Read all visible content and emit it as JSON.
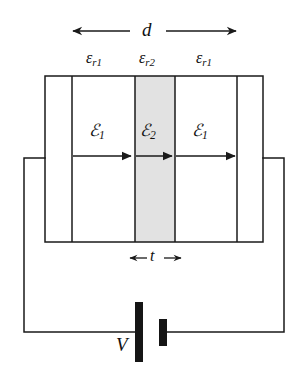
{
  "figure": {
    "colors": {
      "line": "#1a1a1a",
      "background": "#ffffff",
      "slab_fill": "#e2e2e2",
      "battery_fill": "#151515"
    }
  },
  "dimensions": {
    "total_gap": {
      "symbol": "d",
      "description": "total separation between capacitor plates"
    },
    "slab_thickness": {
      "symbol": "t",
      "description": "thickness of the middle dielectric slab"
    }
  },
  "dielectrics": [
    {
      "id": "left",
      "base": "ε",
      "subscript": "r1",
      "shaded": false
    },
    {
      "id": "middle",
      "base": "ε",
      "subscript": "r2",
      "shaded": true
    },
    {
      "id": "right",
      "base": "ε",
      "subscript": "r1",
      "shaded": false
    }
  ],
  "fields": [
    {
      "id": "left",
      "base": "ℰ",
      "subscript": "1",
      "direction": "right"
    },
    {
      "id": "middle",
      "base": "ℰ",
      "subscript": "2",
      "direction": "right"
    },
    {
      "id": "right",
      "base": "ℰ",
      "subscript": "1",
      "direction": "right"
    }
  ],
  "source": {
    "symbol": "V",
    "type": "battery",
    "description": "DC voltage source driving the capacitor"
  }
}
